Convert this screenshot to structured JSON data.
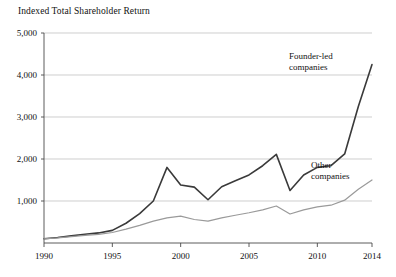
{
  "chart_data": {
    "type": "line",
    "title": "Indexed Total Shareholder Return",
    "xlabel": "",
    "ylabel": "",
    "xlim": [
      1990,
      2014
    ],
    "ylim": [
      0,
      5000
    ],
    "grid": true,
    "legend_position": "inline-annotations",
    "x_ticks": [
      "1990",
      "1995",
      "2000",
      "2005",
      "2010",
      "2014"
    ],
    "x_tick_values": [
      1990,
      1995,
      2000,
      2005,
      2010,
      2014
    ],
    "y_ticks": [
      "1,000",
      "2,000",
      "3,000",
      "4,000",
      "5,000"
    ],
    "y_tick_values": [
      1000,
      2000,
      3000,
      4000,
      5000
    ],
    "x": [
      1990,
      1991,
      1992,
      1993,
      1994,
      1995,
      1996,
      1997,
      1998,
      1999,
      2000,
      2001,
      2002,
      2003,
      2004,
      2005,
      2006,
      2007,
      2008,
      2009,
      2010,
      2011,
      2012,
      2013,
      2014
    ],
    "series": [
      {
        "name": "Founder-led companies",
        "color": "#3a3a3a",
        "width": 1.6,
        "label_line1": "Founder-led",
        "label_line2": "companies",
        "values": [
          100,
          130,
          170,
          210,
          240,
          300,
          470,
          700,
          1000,
          1800,
          1380,
          1330,
          1030,
          1340,
          1480,
          1620,
          1840,
          2110,
          1250,
          1620,
          1800,
          1840,
          2120,
          3250,
          4250
        ]
      },
      {
        "name": "Other companies",
        "color": "#9a9a9a",
        "width": 1.2,
        "label_line1": "Other",
        "label_line2": "companies",
        "values": [
          100,
          120,
          150,
          180,
          205,
          250,
          330,
          420,
          520,
          600,
          640,
          560,
          520,
          600,
          660,
          720,
          790,
          880,
          690,
          790,
          860,
          900,
          1020,
          1280,
          1500
        ]
      }
    ]
  },
  "annotations": {
    "founder_led_line1": "Founder-led",
    "founder_led_line2": "companies",
    "other_line1": "Other",
    "other_line2": "companies"
  }
}
